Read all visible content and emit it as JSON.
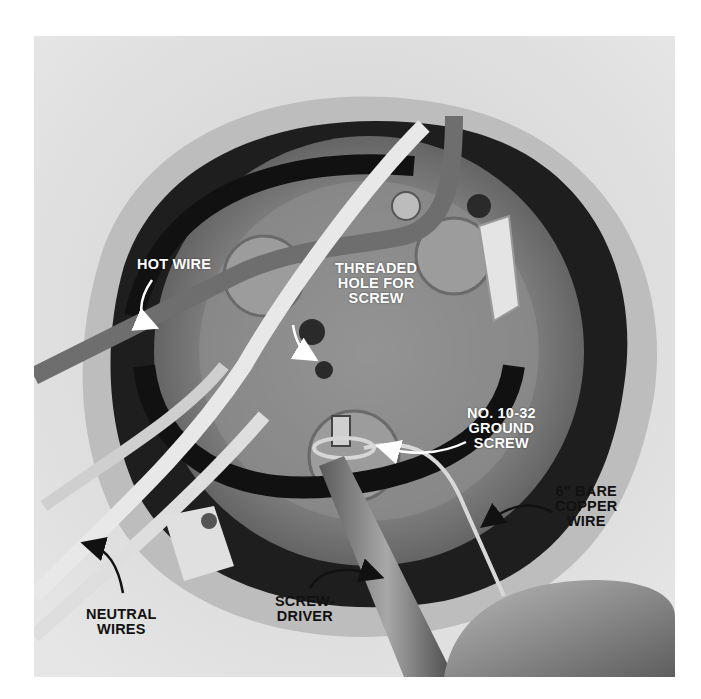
{
  "photo": {
    "subject": "electrical box in drywall with wires, screwdriver and ground screw",
    "colors": {
      "drywall": "#d9d9d9",
      "box_metal": "#8a8a8a",
      "cavity": "#1a1a1a",
      "label_light": "#ffffff",
      "label_dark": "#111111"
    }
  },
  "labels": {
    "hot_wire": "HOT WIRE",
    "threaded_hole": "THREADED\nHOLE FOR\nSCREW",
    "ground_screw": "NO. 10-32\nGROUND\nSCREW",
    "copper_wire": "6\" BARE\nCOPPER\nWIRE",
    "neutral_wires": "NEUTRAL\nWIRES",
    "screwdriver": "SCREW-\nDRIVER"
  }
}
